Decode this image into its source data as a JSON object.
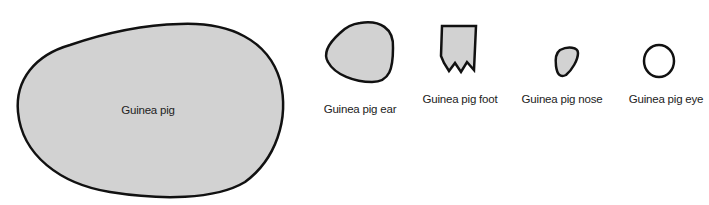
{
  "diagram": {
    "fill_color": "#d2d2d2",
    "stroke_color": "#111111",
    "background": "#ffffff",
    "shapes": [
      {
        "id": "body",
        "label": "Guinea pig",
        "kind": "rounded-egg"
      },
      {
        "id": "ear",
        "label": "Guinea pig ear",
        "kind": "rounded-triangle"
      },
      {
        "id": "foot",
        "label": "Guinea pig foot",
        "kind": "jagged-rectangle"
      },
      {
        "id": "nose",
        "label": "Guinea pig nose",
        "kind": "rounded-triangle-small"
      },
      {
        "id": "eye",
        "label": "Guinea pig eye",
        "kind": "circle-outline"
      }
    ]
  }
}
